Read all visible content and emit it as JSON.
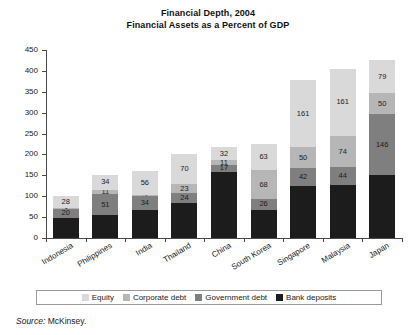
{
  "chart_data": {
    "type": "bar",
    "subtype": "stacked-bar",
    "title": "Financial Depth, 2004",
    "subtitle": "Financial Assets as a Percent of GDP",
    "xlabel": "",
    "ylabel": "",
    "ylim": [
      0,
      450
    ],
    "yticks": [
      0,
      50,
      100,
      150,
      200,
      250,
      300,
      350,
      400,
      450
    ],
    "grid": false,
    "legend_position": "bottom",
    "categories": [
      "Indonesia",
      "Philippines",
      "India",
      "Thailand",
      "China",
      "South Korea",
      "Singapore",
      "Malaysia",
      "Japan"
    ],
    "series": [
      {
        "name": "Bank deposits",
        "color": "#1c1c1c",
        "values": [
          49,
          54,
          67,
          83,
          158,
          68,
          125,
          126,
          150
        ]
      },
      {
        "name": "Government debt",
        "color": "#7f7f7f",
        "values": [
          20,
          51,
          34,
          24,
          17,
          26,
          42,
          44,
          146
        ]
      },
      {
        "name": "Corporate debt",
        "color": "#b6b6b6",
        "values": [
          3,
          11,
          3,
          23,
          11,
          68,
          50,
          74,
          50
        ]
      },
      {
        "name": "Equity",
        "color": "#d9d9d9",
        "values": [
          28,
          34,
          56,
          70,
          32,
          63,
          161,
          161,
          79
        ]
      }
    ],
    "visible_value_labels": {
      "Indonesia": {
        "equity": "28",
        "corporate": "3",
        "government": "20",
        "deposits": ""
      },
      "Philippines": {
        "equity": "34",
        "corporate": "11",
        "government": "51",
        "deposits": ""
      },
      "India": {
        "equity": "56",
        "corporate": "3",
        "government": "34",
        "deposits": ""
      },
      "Thailand": {
        "equity": "70",
        "corporate": "23",
        "government": "24",
        "deposits": ""
      },
      "China": {
        "equity": "32",
        "corporate": "11",
        "government": "17",
        "deposits": ""
      },
      "South Korea": {
        "equity": "63",
        "corporate": "68",
        "government": "26",
        "deposits": ""
      },
      "Singapore": {
        "equity": "161",
        "corporate": "50",
        "government": "42",
        "deposits": ""
      },
      "Malaysia": {
        "equity": "161",
        "corporate": "74",
        "government": "44",
        "deposits": ""
      },
      "Japan": {
        "equity": "79",
        "corporate": "50",
        "government": "146",
        "deposits": ""
      }
    }
  },
  "legend": {
    "items": [
      {
        "label": "Equity",
        "color": "#d9d9d9"
      },
      {
        "label": "Corporate debt",
        "color": "#b6b6b6"
      },
      {
        "label": "Government debt",
        "color": "#7f7f7f"
      },
      {
        "label": "Bank deposits",
        "color": "#1c1c1c"
      }
    ]
  },
  "source": {
    "prefix": "Source:",
    "text": "McKinsey."
  }
}
